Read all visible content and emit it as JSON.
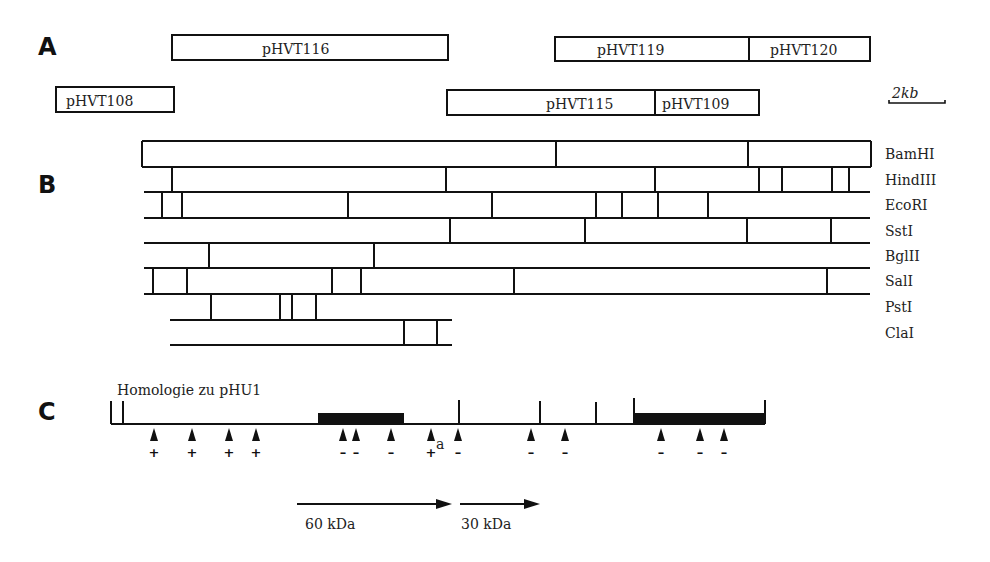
{
  "panels": {
    "a": "A",
    "b": "B",
    "c": "C"
  },
  "scale_bar": {
    "label": "2kb",
    "x1": 889,
    "x2": 945,
    "y": 103
  },
  "clones": [
    {
      "name": "pHVT116",
      "x": 172,
      "y": 35,
      "w": 276,
      "h": 25,
      "tx": 262
    },
    {
      "name": "pHVT119",
      "x": 555,
      "y": 37,
      "w": 194,
      "h": 24,
      "tx": 597
    },
    {
      "name": "pHVT120",
      "x": 749,
      "y": 37,
      "w": 121,
      "h": 24,
      "tx": 770
    },
    {
      "name": "pHVT108",
      "x": 56,
      "y": 87,
      "w": 118,
      "h": 25,
      "tx": 66
    },
    {
      "name": "pHVT115",
      "x": 447,
      "y": 90,
      "w": 208,
      "h": 25,
      "tx": 546
    },
    {
      "name": "pHVT109",
      "x": 655,
      "y": 90,
      "w": 104,
      "h": 25,
      "tx": 662
    }
  ],
  "restriction_map": {
    "lines": [
      {
        "y": 141,
        "x1": 142,
        "x2": 871
      },
      {
        "y": 167,
        "x1": 142,
        "x2": 871
      },
      {
        "y": 192,
        "x1": 144,
        "x2": 870
      },
      {
        "y": 218,
        "x1": 144,
        "x2": 870
      },
      {
        "y": 243,
        "x1": 144,
        "x2": 870
      },
      {
        "y": 268,
        "x1": 144,
        "x2": 870
      },
      {
        "y": 294,
        "x1": 144,
        "x2": 870
      },
      {
        "y": 320,
        "x1": 170,
        "x2": 452
      },
      {
        "y": 345,
        "x1": 170,
        "x2": 452
      }
    ],
    "enzymes": [
      {
        "name": "BamHI",
        "y1": 141,
        "y2": 167,
        "sites": [
          142,
          556,
          748,
          871
        ]
      },
      {
        "name": "HindIII",
        "y1": 167,
        "y2": 192,
        "sites": [
          172,
          446,
          655,
          759,
          782,
          832,
          849
        ]
      },
      {
        "name": "EcoRI",
        "y1": 192,
        "y2": 218,
        "sites": [
          162,
          182,
          348,
          492,
          596,
          622,
          658,
          708
        ]
      },
      {
        "name": "SstI",
        "y1": 218,
        "y2": 243,
        "sites": [
          450,
          585,
          747,
          831
        ]
      },
      {
        "name": "BglII",
        "y1": 243,
        "y2": 268,
        "sites": [
          209,
          374
        ]
      },
      {
        "name": "SalI",
        "y1": 268,
        "y2": 294,
        "sites": [
          153,
          187,
          332,
          361,
          514,
          827
        ]
      },
      {
        "name": "PstI",
        "y1": 294,
        "y2": 320,
        "sites": [
          211,
          280,
          292,
          316
        ]
      },
      {
        "name": "ClaI",
        "y1": 320,
        "y2": 345,
        "sites": [
          404,
          437
        ]
      }
    ],
    "label_x": 885
  },
  "homology": {
    "title": "Homologie zu pHU1",
    "baseline_y": 424,
    "x1": 111,
    "x2": 765,
    "bars": [
      {
        "x1": 318,
        "x2": 404
      },
      {
        "x1": 634,
        "x2": 765
      }
    ],
    "ticks": [
      {
        "x": 111,
        "top": 401
      },
      {
        "x": 123,
        "top": 401
      },
      {
        "x": 459,
        "top": 400
      },
      {
        "x": 540,
        "top": 401
      },
      {
        "x": 596,
        "top": 402
      },
      {
        "x": 634,
        "top": 398
      },
      {
        "x": 765,
        "top": 400
      }
    ],
    "arrows": [
      {
        "x": 154,
        "sign": "+"
      },
      {
        "x": 192,
        "sign": "+"
      },
      {
        "x": 229,
        "sign": "+"
      },
      {
        "x": 256,
        "sign": "+"
      },
      {
        "x": 343,
        "sign": "-"
      },
      {
        "x": 356,
        "sign": "-"
      },
      {
        "x": 391,
        "sign": "-"
      },
      {
        "x": 431,
        "sign": "+",
        "note": "a"
      },
      {
        "x": 458,
        "sign": "-"
      },
      {
        "x": 531,
        "sign": "-"
      },
      {
        "x": 565,
        "sign": "-"
      },
      {
        "x": 661,
        "sign": "-"
      },
      {
        "x": 700,
        "sign": "-"
      },
      {
        "x": 724,
        "sign": "-"
      }
    ]
  },
  "proteins": [
    {
      "label": "60 kDa",
      "x1": 297,
      "x2": 452,
      "y": 504,
      "tx": 305
    },
    {
      "label": "30 kDa",
      "x1": 460,
      "x2": 540,
      "y": 504,
      "tx": 461
    }
  ]
}
